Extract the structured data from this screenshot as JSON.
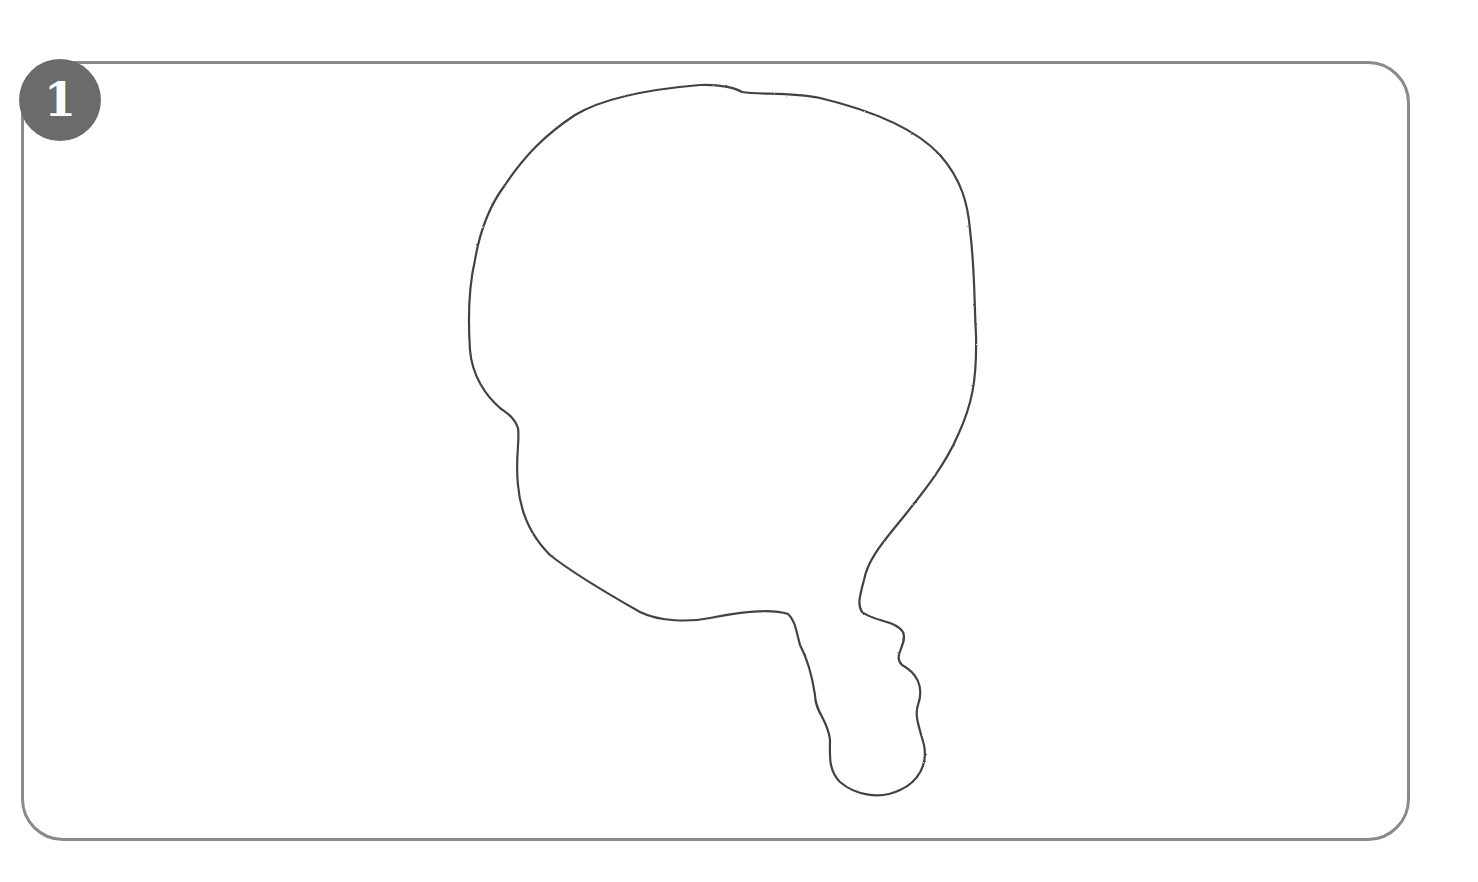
{
  "step": {
    "number": "1"
  },
  "colors": {
    "frame": "#8a8a8a",
    "badge": "#6b6b6b",
    "outline": "#2e2e2e",
    "background": "#ffffff"
  },
  "drawing": {
    "description": "Pencil outline of a rounded blob shape with a small wavy lobe extending down from its lower right",
    "outline_path": "M 700 85 C 720 84, 735 88, 742 92 C 760 95, 790 92, 820 98 C 870 110, 915 128, 940 155 C 962 180, 968 205, 970 230 C 975 270, 974 300, 976 335 C 977 380, 972 405, 958 435 C 945 465, 925 490, 905 515 C 885 540, 868 558, 864 580 C 860 595, 857 605, 862 612 C 875 622, 895 620, 903 632 C 908 645, 892 655, 902 665 C 915 672, 925 685, 918 705 C 914 715, 920 730, 924 745 C 928 765, 918 782, 900 790 C 880 800, 855 795, 840 782 C 828 770, 830 755, 830 740 C 828 720, 815 712, 815 695 C 812 675, 808 660, 800 645 C 796 630, 795 620, 788 614 C 770 608, 740 612, 710 618 C 690 622, 660 622, 640 612 C 610 595, 575 575, 550 555 C 530 535, 520 510, 518 485 C 515 460, 520 440, 518 428 C 515 418, 508 414, 500 408 C 485 395, 472 375, 470 350 C 468 320, 468 290, 475 260 C 480 230, 490 205, 505 185 C 525 155, 545 135, 575 115 C 600 100, 640 90, 700 85 Z"
  }
}
